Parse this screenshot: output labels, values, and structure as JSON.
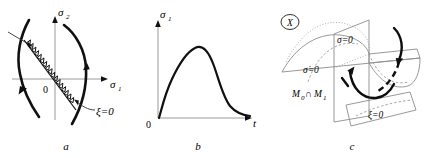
{
  "figure": {
    "caption_labels": [
      "a",
      "b",
      "c"
    ]
  },
  "panel_a": {
    "name": "phase-portrait",
    "y_axis_label": "σ",
    "y_axis_sub": "2",
    "x_axis_label": "σ",
    "x_axis_sub": "1",
    "origin_label": "0",
    "switching_label": "ξ=0",
    "panel_letter": "a"
  },
  "panel_b": {
    "name": "time-response",
    "y_axis_label": "σ",
    "y_axis_sub": "1",
    "x_axis_label": "t",
    "origin_label": "0",
    "panel_letter": "b"
  },
  "panel_c": {
    "name": "manifold-diagram",
    "corner_symbol": "X",
    "sigma_zero_label": "σ=0",
    "sigma_dot_zero_label": "σ̇=0",
    "manifold_label": "M",
    "manifold_sub_0": "0",
    "manifold_intersect": "∩",
    "manifold_sub_1": "1",
    "xi_zero_label": "ξ=0",
    "panel_letter": "c"
  },
  "colors": {
    "ink": "#101010",
    "axis_gray": "#9a9a9a",
    "surface_gray": "#8d8d8d",
    "background": "#ffffff"
  }
}
